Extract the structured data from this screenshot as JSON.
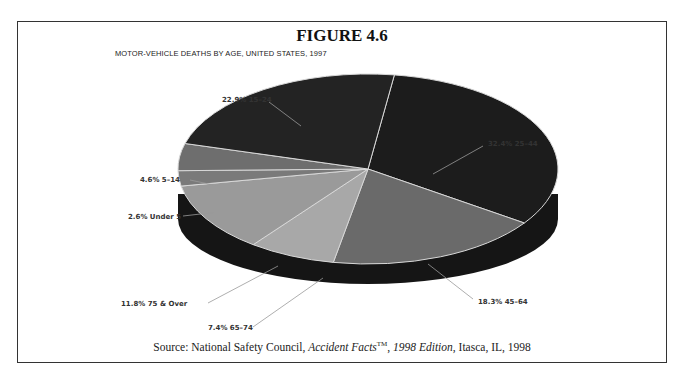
{
  "figure": {
    "label": "FIGURE 4.6",
    "chart_title": "MOTOR-VEHICLE DEATHS BY AGE, UNITED STATES, 1997",
    "source_prefix": "Source: National Safety Council, ",
    "source_publication": "Accident Facts",
    "source_tm": "TM",
    "source_sep": ", ",
    "source_edition": "1998 Edition",
    "source_suffix": ", Itasca, IL, 1998"
  },
  "labels": {
    "l0": "32.4% 25–44",
    "l1": "18.3% 45–64",
    "l2": "7.4% 65–74",
    "l3": "11.8% 75 & Over",
    "l4": "2.6% Under 5",
    "l5": "4.6% 5–14",
    "l6": "22.9% 15–24"
  },
  "chart_data": {
    "type": "pie",
    "title": "MOTOR-VEHICLE DEATHS BY AGE, UNITED STATES, 1997",
    "figure_label": "FIGURE 4.6",
    "style": "3d-pie",
    "categories": [
      "25–44",
      "45–64",
      "65–74",
      "75 & Over",
      "Under 5",
      "5–14",
      "15–24"
    ],
    "values": [
      32.4,
      18.3,
      7.4,
      11.8,
      2.6,
      4.6,
      22.9
    ],
    "unit": "%",
    "colors": [
      "#1c1c1c",
      "#6a6a6a",
      "#a8a8a8",
      "#9a9a9a",
      "#7a7a7a",
      "#6e6e6e",
      "#232323"
    ],
    "source": "National Safety Council, Accident Facts™, 1998 Edition, Itasca, IL, 1998",
    "legend": "none (callout labels)"
  }
}
